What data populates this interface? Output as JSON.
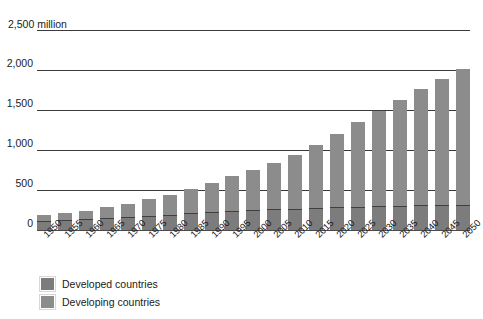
{
  "chart_data": {
    "type": "bar",
    "stacked": true,
    "title": "",
    "subtitle": "",
    "unit_label": "2,500 million",
    "xlabel": "",
    "ylabel": "",
    "ylim": [
      0,
      2500
    ],
    "yticks": [
      0,
      500,
      1000,
      1500,
      2000,
      2500
    ],
    "ytick_labels": [
      "0",
      "500",
      "1,000",
      "1,500",
      "2,000",
      "2,500 million"
    ],
    "grid": true,
    "legend_position": "bottom-left",
    "categories": [
      "1950",
      "1955",
      "1960",
      "1965",
      "1970",
      "1975",
      "1980",
      "1985",
      "1990",
      "1995",
      "2000",
      "2005",
      "2010",
      "2015",
      "2020",
      "2025",
      "2030",
      "2035",
      "2040",
      "2045",
      "2050"
    ],
    "series": [
      {
        "name": "Developed countries",
        "color": "#7c7c7c",
        "values": [
          100,
          110,
          120,
          135,
          150,
          165,
          180,
          195,
          210,
          225,
          235,
          245,
          255,
          265,
          275,
          280,
          285,
          290,
          295,
          300,
          305
        ]
      },
      {
        "name": "Developing countries",
        "color": "#8c8c8c",
        "values": [
          80,
          95,
          110,
          135,
          165,
          205,
          250,
          300,
          370,
          435,
          505,
          580,
          670,
          790,
          915,
          1055,
          1185,
          1320,
          1455,
          1580,
          1690
        ]
      }
    ],
    "totals": [
      180,
      205,
      230,
      270,
      315,
      370,
      430,
      495,
      580,
      660,
      740,
      825,
      925,
      1055,
      1190,
      1335,
      1470,
      1610,
      1750,
      1880,
      1995
    ]
  },
  "legend": {
    "items": [
      {
        "label": "Developed countries",
        "color": "#7c7c7c"
      },
      {
        "label": "Developing countries",
        "color": "#8c8c8c"
      }
    ]
  }
}
